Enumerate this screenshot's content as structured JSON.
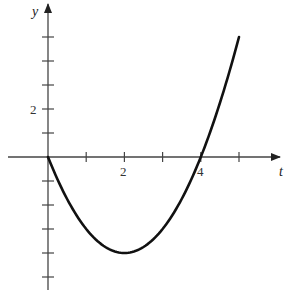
{
  "chart_data": {
    "type": "line",
    "title": "",
    "xlabel": "t",
    "ylabel": "y",
    "xlim": [
      -1.2,
      5.3
    ],
    "ylim": [
      -5.5,
      6.3
    ],
    "grid": false,
    "x_ticks": [
      1,
      2,
      3,
      4,
      5
    ],
    "x_tick_labels": {
      "2": "2",
      "4": "4"
    },
    "y_ticks": [
      -5,
      -4,
      -3,
      -2,
      -1,
      1,
      2,
      3,
      4,
      5
    ],
    "y_tick_labels": {
      "2": "2"
    },
    "function": "y = t^2 - 4t",
    "series": [
      {
        "name": "curve",
        "x": [
          0,
          0.5,
          1,
          1.5,
          2,
          2.5,
          3,
          3.5,
          4,
          4.5,
          5
        ],
        "y": [
          0,
          -1.75,
          -3,
          -3.75,
          -4,
          -3.75,
          -3,
          -1.75,
          0,
          2.25,
          5
        ]
      }
    ]
  },
  "labels": {
    "x_axis": "t",
    "y_axis": "y",
    "x_tick_2": "2",
    "x_tick_4": "4",
    "y_tick_2": "2"
  },
  "colors": {
    "axis": "#333333",
    "curve": "#111111"
  }
}
